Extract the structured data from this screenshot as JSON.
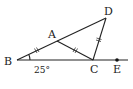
{
  "diagram": {
    "type": "geometry-triangle",
    "points": {
      "B": {
        "label": "B",
        "x": 17,
        "y": 60
      },
      "A": {
        "label": "A",
        "x": 57,
        "y": 41
      },
      "C": {
        "label": "C",
        "x": 93,
        "y": 60
      },
      "D": {
        "label": "D",
        "x": 106,
        "y": 18
      },
      "E": {
        "label": "E",
        "x": 117,
        "y": 60
      }
    },
    "segments": [
      "BD",
      "BE",
      "AC",
      "CD"
    ],
    "equal_marks": [
      "BA",
      "AC",
      "CD"
    ],
    "angle": {
      "vertex": "B",
      "label": "25°"
    },
    "colors": {
      "stroke": "#222222",
      "background": "#ffffff"
    }
  }
}
